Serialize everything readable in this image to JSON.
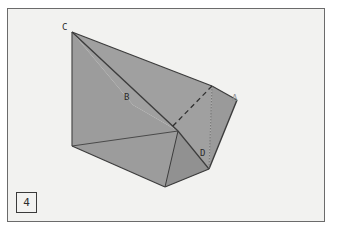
{
  "figure": {
    "number_label": "4",
    "caption": "",
    "background_color": "#f2f2f0",
    "page_color": "#ffffff",
    "frame_border_color": "#6b6b6b",
    "face_fill_color": "#9a9a9a",
    "face_fill_color_light": "#a5a5a5",
    "face_fill_color_dark": "#8e8e8e",
    "edge_color": "#3c3c3c",
    "hidden_edge_color": "#3c3c3c",
    "label_color": "#2b2b2b"
  },
  "geometry": {
    "type": "3d-polyhedron-diagram",
    "description": "Folded planar solid with one hidden dashed edge and one vertical dotted line",
    "vertices": [
      {
        "id": "C",
        "label": "C",
        "x": 72,
        "y": 32,
        "visible_label": true
      },
      {
        "id": "B",
        "label": "B",
        "x": 133,
        "y": 105,
        "visible_label": true
      },
      {
        "id": "A",
        "label": "A",
        "x": 237,
        "y": 100,
        "visible_label": true
      },
      {
        "id": "D",
        "label": "D",
        "x": 209,
        "y": 169,
        "visible_label": true
      },
      {
        "id": "L",
        "label": "",
        "x": 72,
        "y": 146,
        "visible_label": false
      },
      {
        "id": "T",
        "label": "",
        "x": 212,
        "y": 86,
        "visible_label": false
      },
      {
        "id": "M",
        "label": "",
        "x": 165,
        "y": 187,
        "visible_label": false
      },
      {
        "id": "F",
        "label": "",
        "x": 178,
        "y": 131,
        "visible_label": false
      }
    ],
    "edges": [
      {
        "from": "C",
        "to": "L",
        "style": "solid"
      },
      {
        "from": "C",
        "to": "T",
        "style": "solid"
      },
      {
        "from": "C",
        "to": "D",
        "style": "solid"
      },
      {
        "from": "L",
        "to": "D",
        "style": "solid"
      },
      {
        "from": "L",
        "to": "M",
        "style": "solid"
      },
      {
        "from": "M",
        "to": "D",
        "style": "solid"
      },
      {
        "from": "T",
        "to": "A",
        "style": "solid"
      },
      {
        "from": "A",
        "to": "D",
        "style": "solid"
      },
      {
        "from": "T",
        "to": "D",
        "style": "dotted-vertical"
      },
      {
        "from": "T",
        "to": "F",
        "style": "dashed-hidden"
      }
    ],
    "faces": [
      {
        "id": "top-triangle",
        "vertices": [
          "C",
          "T",
          "D"
        ],
        "shade": "light"
      },
      {
        "id": "left-quad",
        "vertices": [
          "C",
          "L",
          "M",
          "D"
        ],
        "shade": "medium"
      },
      {
        "id": "right-quad",
        "vertices": [
          "T",
          "A",
          "D"
        ],
        "shade": "medium"
      },
      {
        "id": "lower-wedge",
        "vertices": [
          "M",
          "D",
          "F"
        ],
        "shade": "dark"
      }
    ]
  },
  "labels": {
    "C": "C",
    "B": "B",
    "A": "A",
    "D": "D"
  }
}
